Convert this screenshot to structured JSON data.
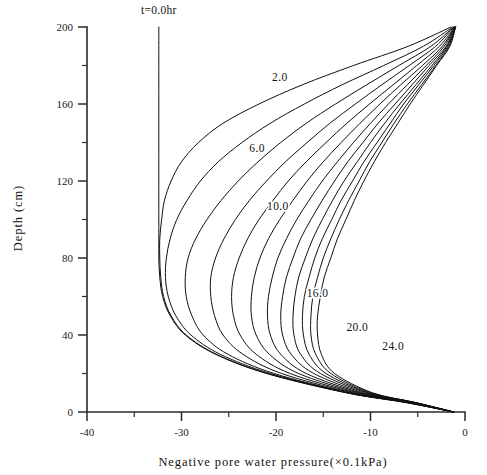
{
  "chart_data": {
    "type": "line",
    "title": "",
    "xlabel": "Negative pore water pressure(×0.1kPa)",
    "ylabel": "Depth (cm)",
    "xlim": [
      -40,
      0
    ],
    "ylim": [
      0,
      200
    ],
    "grid": false,
    "legend_position": "inline-curve-labels",
    "x_ticks_major": [
      "-40",
      "-30",
      "-20",
      "-10",
      "0"
    ],
    "x_ticks_major_values": [
      -40,
      -30,
      -20,
      -10,
      0
    ],
    "x_ticks_minor_values": [
      -35,
      -25,
      -15,
      -5
    ],
    "y_ticks_major": [
      "0",
      "40",
      "80",
      "120",
      "160",
      "200"
    ],
    "y_ticks_major_values": [
      0,
      40,
      80,
      120,
      160,
      200
    ],
    "y_ticks_minor_values": [
      20,
      60,
      100,
      140,
      180
    ],
    "x_unit_note": "×0.1kPa",
    "y_unit_note": "cm",
    "series_variable": "t",
    "series_unit": "hr",
    "annotations": [
      {
        "name": "t0-annotation",
        "text": "t=0.0hr",
        "x": -32.4,
        "y": 207
      },
      {
        "name": "curve-label-2",
        "text": "2.0",
        "x": -19.6,
        "y": 172
      },
      {
        "name": "curve-label-6",
        "text": "6.0",
        "x": -22.0,
        "y": 135
      },
      {
        "name": "curve-label-10",
        "text": "10.0",
        "x": -19.8,
        "y": 105
      },
      {
        "name": "curve-label-16",
        "text": "16.0",
        "x": -15.6,
        "y": 60
      },
      {
        "name": "curve-label-20",
        "text": "20.0",
        "x": -11.4,
        "y": 42
      },
      {
        "name": "curve-label-24",
        "text": "24.0",
        "x": -7.6,
        "y": 32
      }
    ],
    "series": [
      {
        "name": "0.0",
        "label": "t=0.0hr",
        "t_hr": 0,
        "points": [
          [
            -32.4,
            200
          ],
          [
            -32.4,
            160
          ],
          [
            -32.4,
            120
          ],
          [
            -32.4,
            90
          ],
          [
            -32.4,
            80
          ],
          [
            -32.3,
            70
          ],
          [
            -32.0,
            60
          ],
          [
            -31.2,
            50
          ],
          [
            -29.6,
            40
          ],
          [
            -26.4,
            30
          ],
          [
            -21.0,
            20
          ],
          [
            -12.6,
            10
          ],
          [
            -6.4,
            5
          ],
          [
            -1.2,
            0
          ]
        ]
      },
      {
        "name": "2.0",
        "label": "2.0",
        "t_hr": 2,
        "points": [
          [
            -1.5,
            200
          ],
          [
            -6.0,
            190
          ],
          [
            -11.8,
            180
          ],
          [
            -17.2,
            170
          ],
          [
            -21.8,
            160
          ],
          [
            -25.6,
            150
          ],
          [
            -28.2,
            140
          ],
          [
            -30.0,
            130
          ],
          [
            -31.1,
            120
          ],
          [
            -31.8,
            110
          ],
          [
            -32.1,
            100
          ],
          [
            -32.3,
            90
          ],
          [
            -32.3,
            80
          ],
          [
            -32.2,
            70
          ],
          [
            -31.9,
            60
          ],
          [
            -31.1,
            50
          ],
          [
            -29.5,
            40
          ],
          [
            -26.3,
            30
          ],
          [
            -20.9,
            20
          ],
          [
            -12.5,
            10
          ],
          [
            -6.3,
            5
          ],
          [
            -1.2,
            0
          ]
        ]
      },
      {
        "name": "4.0",
        "label": "4.0",
        "t_hr": 4,
        "points": [
          [
            -1.3,
            200
          ],
          [
            -4.4,
            190
          ],
          [
            -8.6,
            180
          ],
          [
            -13.0,
            170
          ],
          [
            -17.0,
            160
          ],
          [
            -20.6,
            150
          ],
          [
            -23.6,
            140
          ],
          [
            -26.1,
            130
          ],
          [
            -28.0,
            120
          ],
          [
            -29.4,
            110
          ],
          [
            -30.5,
            100
          ],
          [
            -31.2,
            90
          ],
          [
            -31.6,
            80
          ],
          [
            -31.7,
            70
          ],
          [
            -31.4,
            60
          ],
          [
            -30.6,
            50
          ],
          [
            -29.0,
            40
          ],
          [
            -25.9,
            30
          ],
          [
            -20.6,
            20
          ],
          [
            -12.4,
            10
          ],
          [
            -6.2,
            5
          ],
          [
            -1.2,
            0
          ]
        ]
      },
      {
        "name": "6.0",
        "label": "6.0",
        "t_hr": 6,
        "points": [
          [
            -1.2,
            200
          ],
          [
            -3.6,
            190
          ],
          [
            -7.0,
            180
          ],
          [
            -10.4,
            170
          ],
          [
            -13.7,
            160
          ],
          [
            -16.8,
            150
          ],
          [
            -19.5,
            140
          ],
          [
            -21.9,
            130
          ],
          [
            -24.0,
            120
          ],
          [
            -25.8,
            110
          ],
          [
            -27.3,
            100
          ],
          [
            -28.5,
            90
          ],
          [
            -29.3,
            80
          ],
          [
            -29.6,
            70
          ],
          [
            -29.5,
            60
          ],
          [
            -28.9,
            50
          ],
          [
            -27.7,
            40
          ],
          [
            -25.1,
            30
          ],
          [
            -20.2,
            20
          ],
          [
            -12.2,
            10
          ],
          [
            -6.1,
            5
          ],
          [
            -1.2,
            0
          ]
        ]
      },
      {
        "name": "8.0",
        "label": "8.0",
        "t_hr": 8,
        "points": [
          [
            -1.2,
            200
          ],
          [
            -3.1,
            190
          ],
          [
            -5.9,
            180
          ],
          [
            -8.8,
            170
          ],
          [
            -11.6,
            160
          ],
          [
            -14.3,
            150
          ],
          [
            -16.7,
            140
          ],
          [
            -19.0,
            130
          ],
          [
            -21.0,
            120
          ],
          [
            -22.8,
            110
          ],
          [
            -24.3,
            100
          ],
          [
            -25.5,
            90
          ],
          [
            -26.4,
            80
          ],
          [
            -26.9,
            70
          ],
          [
            -26.9,
            60
          ],
          [
            -26.5,
            50
          ],
          [
            -25.6,
            40
          ],
          [
            -23.5,
            30
          ],
          [
            -19.4,
            20
          ],
          [
            -11.9,
            10
          ],
          [
            -6.0,
            5
          ],
          [
            -1.2,
            0
          ]
        ]
      },
      {
        "name": "10.0",
        "label": "10.0",
        "t_hr": 10,
        "points": [
          [
            -1.1,
            200
          ],
          [
            -2.7,
            190
          ],
          [
            -5.1,
            180
          ],
          [
            -7.6,
            170
          ],
          [
            -10.1,
            160
          ],
          [
            -12.5,
            150
          ],
          [
            -14.7,
            140
          ],
          [
            -16.8,
            130
          ],
          [
            -18.7,
            120
          ],
          [
            -20.3,
            110
          ],
          [
            -21.8,
            100
          ],
          [
            -23.0,
            90
          ],
          [
            -23.9,
            80
          ],
          [
            -24.5,
            70
          ],
          [
            -24.7,
            60
          ],
          [
            -24.5,
            50
          ],
          [
            -23.8,
            40
          ],
          [
            -22.1,
            30
          ],
          [
            -18.5,
            20
          ],
          [
            -11.6,
            10
          ],
          [
            -5.9,
            5
          ],
          [
            -1.2,
            0
          ]
        ]
      },
      {
        "name": "12.0",
        "label": "12.0",
        "t_hr": 12,
        "points": [
          [
            -1.1,
            200
          ],
          [
            -2.4,
            190
          ],
          [
            -4.5,
            180
          ],
          [
            -6.8,
            170
          ],
          [
            -9.0,
            160
          ],
          [
            -11.1,
            150
          ],
          [
            -13.1,
            140
          ],
          [
            -15.0,
            130
          ],
          [
            -16.7,
            120
          ],
          [
            -18.2,
            110
          ],
          [
            -19.6,
            100
          ],
          [
            -20.8,
            90
          ],
          [
            -21.7,
            80
          ],
          [
            -22.3,
            70
          ],
          [
            -22.6,
            60
          ],
          [
            -22.6,
            50
          ],
          [
            -22.1,
            40
          ],
          [
            -20.7,
            30
          ],
          [
            -17.6,
            20
          ],
          [
            -11.3,
            10
          ],
          [
            -5.8,
            5
          ],
          [
            -1.2,
            0
          ]
        ]
      },
      {
        "name": "14.0",
        "label": "14.0",
        "t_hr": 14,
        "points": [
          [
            -1.1,
            200
          ],
          [
            -2.2,
            190
          ],
          [
            -4.1,
            180
          ],
          [
            -6.1,
            170
          ],
          [
            -8.1,
            160
          ],
          [
            -10.0,
            150
          ],
          [
            -11.8,
            140
          ],
          [
            -13.5,
            130
          ],
          [
            -15.1,
            120
          ],
          [
            -16.5,
            110
          ],
          [
            -17.8,
            100
          ],
          [
            -18.9,
            90
          ],
          [
            -19.8,
            80
          ],
          [
            -20.4,
            70
          ],
          [
            -20.8,
            60
          ],
          [
            -20.9,
            50
          ],
          [
            -20.6,
            40
          ],
          [
            -19.5,
            30
          ],
          [
            -16.8,
            20
          ],
          [
            -11.0,
            10
          ],
          [
            -5.7,
            5
          ],
          [
            -1.2,
            0
          ]
        ]
      },
      {
        "name": "16.0",
        "label": "16.0",
        "t_hr": 16,
        "points": [
          [
            -1.1,
            200
          ],
          [
            -2.0,
            190
          ],
          [
            -3.8,
            180
          ],
          [
            -5.6,
            170
          ],
          [
            -7.4,
            160
          ],
          [
            -9.2,
            150
          ],
          [
            -10.8,
            140
          ],
          [
            -12.4,
            130
          ],
          [
            -13.8,
            120
          ],
          [
            -15.1,
            110
          ],
          [
            -16.3,
            100
          ],
          [
            -17.4,
            90
          ],
          [
            -18.2,
            80
          ],
          [
            -18.9,
            70
          ],
          [
            -19.3,
            60
          ],
          [
            -19.5,
            50
          ],
          [
            -19.3,
            40
          ],
          [
            -18.4,
            30
          ],
          [
            -16.0,
            20
          ],
          [
            -10.7,
            10
          ],
          [
            -5.6,
            5
          ],
          [
            -1.2,
            0
          ]
        ]
      },
      {
        "name": "18.0",
        "label": "18.0",
        "t_hr": 18,
        "points": [
          [
            -1.0,
            200
          ],
          [
            -1.9,
            190
          ],
          [
            -3.5,
            180
          ],
          [
            -5.2,
            170
          ],
          [
            -6.9,
            160
          ],
          [
            -8.5,
            150
          ],
          [
            -10.0,
            140
          ],
          [
            -11.4,
            130
          ],
          [
            -12.8,
            120
          ],
          [
            -14.0,
            110
          ],
          [
            -15.1,
            100
          ],
          [
            -16.1,
            90
          ],
          [
            -16.9,
            80
          ],
          [
            -17.6,
            70
          ],
          [
            -18.0,
            60
          ],
          [
            -18.2,
            50
          ],
          [
            -18.1,
            40
          ],
          [
            -17.4,
            30
          ],
          [
            -15.3,
            20
          ],
          [
            -10.4,
            10
          ],
          [
            -5.5,
            5
          ],
          [
            -1.2,
            0
          ]
        ]
      },
      {
        "name": "20.0",
        "label": "20.0",
        "t_hr": 20,
        "points": [
          [
            -1.0,
            200
          ],
          [
            -1.8,
            190
          ],
          [
            -3.3,
            180
          ],
          [
            -4.9,
            170
          ],
          [
            -6.5,
            160
          ],
          [
            -7.9,
            150
          ],
          [
            -9.3,
            140
          ],
          [
            -10.7,
            130
          ],
          [
            -11.9,
            120
          ],
          [
            -13.1,
            110
          ],
          [
            -14.1,
            100
          ],
          [
            -15.1,
            90
          ],
          [
            -15.9,
            80
          ],
          [
            -16.5,
            70
          ],
          [
            -17.0,
            60
          ],
          [
            -17.2,
            50
          ],
          [
            -17.1,
            40
          ],
          [
            -16.5,
            30
          ],
          [
            -14.7,
            20
          ],
          [
            -10.2,
            10
          ],
          [
            -5.4,
            5
          ],
          [
            -1.2,
            0
          ]
        ]
      },
      {
        "name": "22.0",
        "label": "22.0",
        "t_hr": 22,
        "points": [
          [
            -1.0,
            200
          ],
          [
            -1.7,
            190
          ],
          [
            -3.1,
            180
          ],
          [
            -4.6,
            170
          ],
          [
            -6.1,
            160
          ],
          [
            -7.5,
            150
          ],
          [
            -8.8,
            140
          ],
          [
            -10.1,
            130
          ],
          [
            -11.2,
            120
          ],
          [
            -12.3,
            110
          ],
          [
            -13.3,
            100
          ],
          [
            -14.2,
            90
          ],
          [
            -15.0,
            80
          ],
          [
            -15.6,
            70
          ],
          [
            -16.1,
            60
          ],
          [
            -16.3,
            50
          ],
          [
            -16.3,
            40
          ],
          [
            -15.8,
            30
          ],
          [
            -14.2,
            20
          ],
          [
            -10.0,
            10
          ],
          [
            -5.3,
            5
          ],
          [
            -1.2,
            0
          ]
        ]
      },
      {
        "name": "24.0",
        "label": "24.0",
        "t_hr": 24,
        "points": [
          [
            -1.0,
            200
          ],
          [
            -1.6,
            190
          ],
          [
            -3.0,
            180
          ],
          [
            -4.4,
            170
          ],
          [
            -5.8,
            160
          ],
          [
            -7.1,
            150
          ],
          [
            -8.4,
            140
          ],
          [
            -9.6,
            130
          ],
          [
            -10.7,
            120
          ],
          [
            -11.7,
            110
          ],
          [
            -12.6,
            100
          ],
          [
            -13.5,
            90
          ],
          [
            -14.2,
            80
          ],
          [
            -14.9,
            70
          ],
          [
            -15.3,
            60
          ],
          [
            -15.6,
            50
          ],
          [
            -15.6,
            40
          ],
          [
            -15.2,
            30
          ],
          [
            -13.8,
            20
          ],
          [
            -9.8,
            10
          ],
          [
            -5.3,
            5
          ],
          [
            -1.2,
            0
          ]
        ]
      }
    ]
  }
}
